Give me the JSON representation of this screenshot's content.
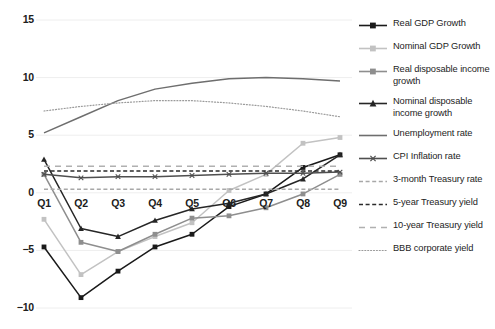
{
  "chart_data": {
    "type": "line",
    "title": "",
    "subtitle": "",
    "xlabel": "",
    "ylabel": "",
    "grid": true,
    "legend_position": "right",
    "categories": [
      "Q1",
      "Q2",
      "Q3",
      "Q4",
      "Q5",
      "Q6",
      "Q7",
      "Q8",
      "Q9"
    ],
    "xtick_labels": [
      "Q1",
      "Q2",
      "Q3",
      "Q4",
      "Q5",
      "Q6",
      "Q7",
      "Q8",
      "Q9"
    ],
    "ytick_labels": [
      "15",
      "10",
      "5",
      "0",
      "−5",
      "−10"
    ],
    "ytick_values": [
      15,
      10,
      5,
      0,
      -5,
      -10
    ],
    "ylim": [
      -10,
      15
    ],
    "series": [
      {
        "name": "Real GDP Growth",
        "color": "#1a1a1a",
        "marker": "square",
        "dash": "solid",
        "values": [
          -4.7,
          -9.1,
          -6.8,
          -4.7,
          -3.6,
          -1.2,
          -0.1,
          2.2,
          3.3
        ]
      },
      {
        "name": "Nominal GDP Growth",
        "color": "#c2c2c2",
        "marker": "square",
        "dash": "solid",
        "values": [
          -2.3,
          -7.1,
          -5.1,
          -3.8,
          -2.6,
          0.2,
          1.6,
          4.3,
          4.8
        ]
      },
      {
        "name": "Real disposable income growth",
        "color": "#8e8e8e",
        "marker": "square",
        "dash": "solid",
        "values": [
          1.6,
          -4.3,
          -5.1,
          -3.6,
          -2.2,
          -2.0,
          -1.3,
          -0.1,
          1.6
        ]
      },
      {
        "name": "Nominal disposable income growth",
        "color": "#262626",
        "marker": "triangle",
        "dash": "solid",
        "values": [
          2.9,
          -3.1,
          -3.8,
          -2.4,
          -1.4,
          -0.9,
          -0.1,
          1.2,
          3.3
        ]
      },
      {
        "name": "Unemployment rate",
        "color": "#6e6e6e",
        "marker": "none",
        "dash": "solid",
        "values": [
          5.2,
          6.6,
          8.0,
          9.0,
          9.5,
          9.9,
          10.0,
          9.9,
          9.7
        ]
      },
      {
        "name": "CPI Inflation rate",
        "color": "#4f4f4f",
        "marker": "x",
        "dash": "solid",
        "values": [
          1.6,
          1.3,
          1.4,
          1.4,
          1.5,
          1.6,
          1.7,
          1.7,
          1.8
        ]
      },
      {
        "name": "3-month Treasury rate",
        "color": "#a8a8a8",
        "marker": "none",
        "dash": "dashed",
        "values": [
          0.3,
          0.3,
          0.3,
          0.3,
          0.3,
          0.3,
          0.3,
          0.3,
          0.3
        ]
      },
      {
        "name": "5-year Treasury yield",
        "color": "#2b2b2b",
        "marker": "none",
        "dash": "dashed",
        "values": [
          1.9,
          1.9,
          1.9,
          1.9,
          1.9,
          1.9,
          1.9,
          1.9,
          1.9
        ]
      },
      {
        "name": "10-year Treasury yield",
        "color": "#b0b0b0",
        "marker": "none",
        "dash": "longdash",
        "values": [
          2.3,
          2.3,
          2.3,
          2.3,
          2.3,
          2.3,
          2.3,
          2.3,
          2.3
        ]
      },
      {
        "name": "BBB corporate yield",
        "color": "#9a9a9a",
        "marker": "none",
        "dash": "dotted",
        "values": [
          7.1,
          7.5,
          7.8,
          8.0,
          8.0,
          7.8,
          7.5,
          7.1,
          6.6
        ]
      }
    ]
  },
  "legend": {
    "entries": [
      {
        "label": "Real GDP Growth"
      },
      {
        "label": "Nominal GDP Growth"
      },
      {
        "label": "Real disposable income growth"
      },
      {
        "label": "Nominal disposable income growth"
      },
      {
        "label": "Unemployment rate"
      },
      {
        "label": "CPI Inflation rate"
      },
      {
        "label": "3-month Treasury rate"
      },
      {
        "label": "5-year Treasury yield"
      },
      {
        "label": "10-year Treasury yield"
      },
      {
        "label": "BBB corporate yield"
      }
    ]
  }
}
